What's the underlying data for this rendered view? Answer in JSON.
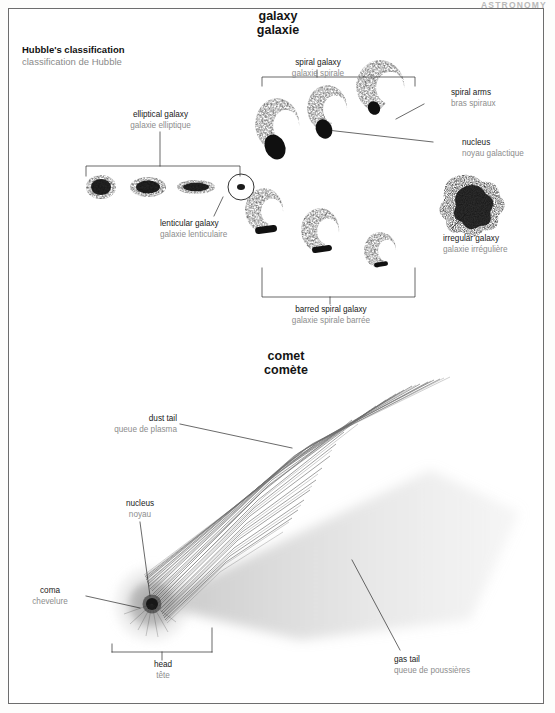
{
  "page": {
    "corner_header": "ASTRONOMY",
    "frame_border_color": "#6d6d6d",
    "background": "#ffffff",
    "label_en_color": "#1a1a1a",
    "label_fr_color": "#8d8d8d"
  },
  "sections": {
    "galaxy": {
      "title_en": "galaxy",
      "title_fr": "galaxie",
      "subtitle_en": "Hubble's classification",
      "subtitle_fr": "classification de Hubble",
      "labels": [
        {
          "key": "spiral",
          "en": "spiral galaxy",
          "fr": "galaxie spirale"
        },
        {
          "key": "spiral_arms",
          "en": "spiral arms",
          "fr": "bras spiraux"
        },
        {
          "key": "nucleus",
          "en": "nucleus",
          "fr": "noyau galactique"
        },
        {
          "key": "elliptical",
          "en": "elliptical galaxy",
          "fr": "galaxie elliptique"
        },
        {
          "key": "lenticular",
          "en": "lenticular galaxy",
          "fr": "galaxie lenticulaire"
        },
        {
          "key": "irregular",
          "en": "irregular galaxy",
          "fr": "galaxie irrégulière"
        },
        {
          "key": "barred_spiral",
          "en": "barred spiral galaxy",
          "fr": "galaxie spirale barrée"
        }
      ]
    },
    "comet": {
      "title_en": "comet",
      "title_fr": "comète",
      "labels": [
        {
          "key": "dust_tail",
          "en": "dust tail",
          "fr": "queue de plasma"
        },
        {
          "key": "nucleus",
          "en": "nucleus",
          "fr": "noyau"
        },
        {
          "key": "coma",
          "en": "coma",
          "fr": "chevelure"
        },
        {
          "key": "head",
          "en": "head",
          "fr": "tête"
        },
        {
          "key": "gas_tail",
          "en": "gas tail",
          "fr": "queue de poussières"
        }
      ]
    }
  }
}
